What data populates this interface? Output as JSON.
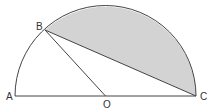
{
  "diagram": {
    "type": "semicircle-geometry",
    "points": {
      "A": {
        "label": "A",
        "x": 15,
        "y": 96
      },
      "B": {
        "label": "B",
        "x": 45,
        "y": 30
      },
      "C": {
        "label": "C",
        "x": 196,
        "y": 96
      },
      "O": {
        "label": "O",
        "x": 105.5,
        "y": 96
      }
    },
    "segments": [
      "AC",
      "OB",
      "BC"
    ],
    "arc": {
      "from": "A",
      "to": "C",
      "center": "O",
      "radius": 90.5
    },
    "shaded_region": "segment between chord BC and arc BC",
    "colors": {
      "stroke": "#444444",
      "shade": "#d3d3d3",
      "label": "#333333",
      "background": "#ffffff"
    }
  }
}
